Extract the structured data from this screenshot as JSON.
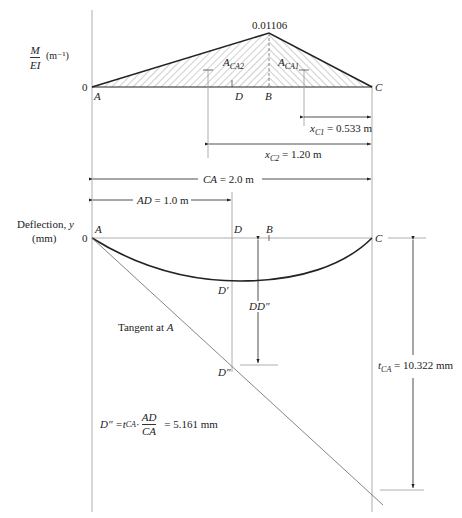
{
  "diagram": {
    "type": "moment-area deflection diagram",
    "colors": {
      "line": "#222222",
      "thin_line": "#888888",
      "hatch": "#555555"
    }
  },
  "moment_diagram": {
    "ylabel_num": "M",
    "ylabel_den": "EI",
    "ylabel_unit": "(m⁻¹)",
    "zero": "0",
    "peak_value": "0.01106",
    "points": {
      "A": "A",
      "B": "B",
      "C": "C",
      "D": "D"
    },
    "area_labels": {
      "a_ca2": "A",
      "a_ca2_sub": "CA2",
      "a_ca1": "A",
      "a_ca1_sub": "CA1"
    }
  },
  "dimensions": {
    "xc1": {
      "var": "x",
      "sub": "C1",
      "value": " = 0.533 m"
    },
    "xc2": {
      "var": "x",
      "sub": "C2",
      "value": " = 1.20 m"
    },
    "ca": {
      "label": "CA",
      "value": " = 2.0 m"
    },
    "ad": {
      "label": "AD",
      "value": " = 1.0 m"
    }
  },
  "deflection_diagram": {
    "ylabel_line1": "Deflection, ",
    "ylabel_var": "y",
    "ylabel_line2": "(mm)",
    "zero": "0",
    "points": {
      "A": "A",
      "D": "D",
      "B": "B",
      "C": "C",
      "D_prime": "D′",
      "D_dprime": "D″"
    },
    "dd_label": "DD″",
    "tangent_label": "Tangent at ",
    "tangent_point": "A",
    "tca": {
      "var": "t",
      "sub": "CA",
      "value": " = 10.322 mm"
    }
  },
  "formula": {
    "lhs": "D″ = ",
    "t": "t",
    "t_sub": "CA",
    "dot": " · ",
    "num": "AD",
    "den": "CA",
    "rhs": " = 5.161 mm"
  }
}
